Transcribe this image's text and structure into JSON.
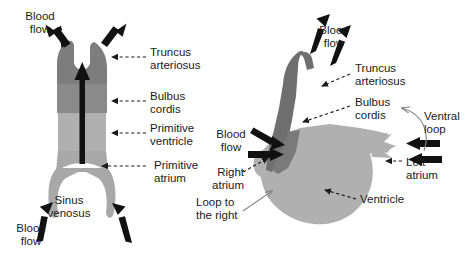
{
  "figure": {
    "background_color": "#ffffff",
    "text_color": "#1a1a1a"
  },
  "colors": {
    "dark_segment": "#7d7d7d",
    "mid_segment": "#8f8f8f",
    "light_segment": "#b0b0b0",
    "pale_segment": "#a8a8a8",
    "arrow_black": "#111111",
    "leader_line": "#1a1a1a",
    "thin_pointer": "#888888"
  },
  "panels": [
    {
      "id": "left-panel",
      "name": "straight-heart-tube",
      "labels": [
        {
          "id": "l-blood-flow-top",
          "text": "Blood\nflow",
          "x": 40,
          "y": 10,
          "align": "center"
        },
        {
          "id": "l-truncus",
          "text": "Truncus\narteriosus",
          "x": 150,
          "y": 46,
          "align": "left"
        },
        {
          "id": "l-bulbus",
          "text": "Bulbus\ncordis",
          "x": 150,
          "y": 90,
          "align": "left"
        },
        {
          "id": "l-primitive-ventricle",
          "text": "Primitive\nventricle",
          "x": 150,
          "y": 122,
          "align": "left"
        },
        {
          "id": "l-primitive-atrium",
          "text": "Primitive\natrium",
          "x": 150,
          "y": 164,
          "align": "left"
        },
        {
          "id": "l-sinus-venosus",
          "text": "Sinus\nvenosus",
          "x": 68,
          "y": 196,
          "align": "center"
        },
        {
          "id": "l-blood-flow-bottom",
          "text": "Blood\nflow",
          "x": 8,
          "y": 224,
          "align": "left"
        }
      ]
    },
    {
      "id": "right-panel",
      "name": "looped-heart",
      "labels": [
        {
          "id": "r-blood-flow-top",
          "text": "Blood\nflow",
          "x": 318,
          "y": 26,
          "align": "center"
        },
        {
          "id": "r-truncus",
          "text": "Truncus\narteriosus",
          "x": 352,
          "y": 64,
          "align": "left"
        },
        {
          "id": "r-bulbus",
          "text": "Bulbus\ncordis",
          "x": 352,
          "y": 98,
          "align": "left"
        },
        {
          "id": "r-ventral-loop",
          "text": "Ventral\nloop",
          "x": 412,
          "y": 112,
          "align": "left"
        },
        {
          "id": "r-blood-flow-left",
          "text": "Blood\nflow",
          "x": 214,
          "y": 130,
          "align": "left"
        },
        {
          "id": "r-right-atrium",
          "text": "Right\natrium",
          "x": 212,
          "y": 168,
          "align": "left"
        },
        {
          "id": "r-left-atrium",
          "text": "Left\natrium",
          "x": 404,
          "y": 158,
          "align": "left"
        },
        {
          "id": "r-ventricle",
          "text": "Ventricle",
          "x": 360,
          "y": 196,
          "align": "left"
        },
        {
          "id": "r-loop-to-right",
          "text": "Loop to\nthe right",
          "x": 200,
          "y": 198,
          "align": "left"
        }
      ]
    }
  ],
  "anatomy": {
    "left_tube_segments": [
      "truncus arteriosus",
      "bulbus cordis",
      "primitive ventricle",
      "primitive atrium",
      "sinus venosus"
    ],
    "right_heart_segments": [
      "truncus arteriosus",
      "bulbus cordis",
      "right atrium",
      "left atrium",
      "ventricle"
    ],
    "flow_direction_left": "upward through tube",
    "loop_direction": "to the right (ventral loop)"
  }
}
